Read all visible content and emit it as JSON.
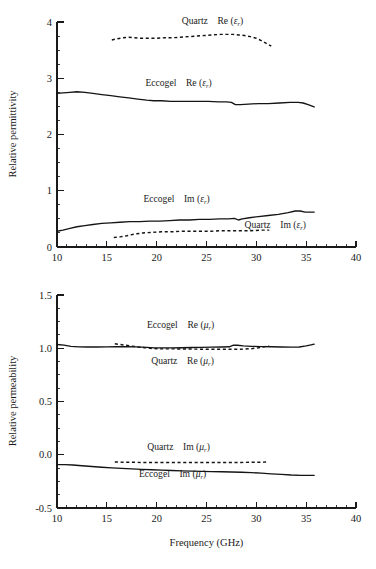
{
  "figure": {
    "name": "permittivity-permeability-vs-frequency",
    "background": "#ffffff",
    "line_color": "#141414"
  },
  "chart_data": [
    {
      "id": "permittivity",
      "type": "line",
      "title": "",
      "xlabel": "",
      "ylabel": "Relative permittivity",
      "xlim": [
        10,
        40
      ],
      "ylim": [
        0,
        4
      ],
      "xticks": [
        10,
        15,
        20,
        25,
        30,
        35,
        40
      ],
      "xticklabels": [
        "10",
        "15",
        "20",
        "25",
        "30",
        "35",
        "40"
      ],
      "yticks": [
        0,
        1,
        2,
        3,
        4
      ],
      "yticklabels": [
        "0",
        "1",
        "2",
        "3",
        "4"
      ],
      "xminor_step": 1,
      "yminor_step": 0.25,
      "grid": false,
      "legend_position": "inline-annotations",
      "series": [
        {
          "name": "Quartz Re (εr)",
          "label_material": "Quartz",
          "label_quantity_prefix": "Re",
          "label_symbol": "ε",
          "label_subscript": "r",
          "style": "dashed",
          "label_x": 25.6,
          "label_y": 3.97,
          "x": [
            15.5,
            16.0,
            16.6,
            17.2,
            17.8,
            18.5,
            19.2,
            20.0,
            20.8,
            21.6,
            22.4,
            23.2,
            24.0,
            24.8,
            25.6,
            26.4,
            27.0,
            27.6,
            28.2,
            28.8,
            29.4,
            30.0,
            30.5,
            31.0,
            31.5
          ],
          "y": [
            3.68,
            3.7,
            3.72,
            3.73,
            3.72,
            3.71,
            3.71,
            3.71,
            3.72,
            3.72,
            3.73,
            3.74,
            3.75,
            3.76,
            3.77,
            3.78,
            3.78,
            3.78,
            3.77,
            3.76,
            3.74,
            3.71,
            3.67,
            3.62,
            3.57
          ]
        },
        {
          "name": "Eccogel Re (εr)",
          "label_material": "Eccogel",
          "label_quantity_prefix": "Re",
          "label_symbol": "ε",
          "label_subscript": "r",
          "style": "solid",
          "label_x": 22.2,
          "label_y": 2.86,
          "x": [
            10.0,
            10.6,
            11.3,
            12.0,
            12.8,
            13.6,
            14.5,
            15.4,
            16.3,
            17.2,
            18.1,
            19.0,
            19.7,
            20.5,
            21.4,
            22.3,
            23.2,
            24.2,
            25.2,
            26.2,
            27.0,
            27.5,
            27.9,
            28.4,
            29.2,
            30.2,
            31.2,
            32.3,
            33.4,
            34.2,
            34.7,
            35.2,
            35.8
          ],
          "y": [
            2.73,
            2.74,
            2.75,
            2.76,
            2.75,
            2.73,
            2.71,
            2.69,
            2.67,
            2.65,
            2.63,
            2.61,
            2.6,
            2.6,
            2.59,
            2.59,
            2.59,
            2.59,
            2.59,
            2.58,
            2.58,
            2.57,
            2.53,
            2.53,
            2.54,
            2.55,
            2.55,
            2.56,
            2.57,
            2.57,
            2.56,
            2.53,
            2.49
          ]
        },
        {
          "name": "Eccogel Im (εr)",
          "label_material": "Eccogel",
          "label_quantity_prefix": "Im",
          "label_symbol": "ε",
          "label_subscript": "r",
          "style": "solid",
          "label_x": 22.0,
          "label_y": 0.8,
          "x": [
            10.0,
            10.6,
            11.3,
            12.0,
            12.8,
            13.6,
            14.5,
            15.4,
            16.3,
            17.3,
            18.3,
            19.3,
            20.3,
            21.3,
            22.3,
            23.3,
            24.3,
            25.3,
            26.3,
            27.2,
            27.8,
            28.2,
            28.6,
            29.3,
            30.2,
            31.2,
            32.2,
            33.2,
            33.9,
            34.4,
            34.9,
            35.4,
            35.8
          ],
          "y": [
            0.28,
            0.3,
            0.33,
            0.36,
            0.38,
            0.4,
            0.42,
            0.43,
            0.44,
            0.45,
            0.45,
            0.46,
            0.46,
            0.47,
            0.48,
            0.48,
            0.49,
            0.49,
            0.5,
            0.5,
            0.51,
            0.48,
            0.5,
            0.52,
            0.54,
            0.56,
            0.58,
            0.61,
            0.64,
            0.64,
            0.62,
            0.62,
            0.62
          ]
        },
        {
          "name": "Quartz Im (εr)",
          "label_material": "Quartz",
          "label_quantity_prefix": "Im",
          "label_symbol": "ε",
          "label_subscript": "r",
          "style": "dashed",
          "label_x": 31.9,
          "label_y": 0.33,
          "x": [
            15.7,
            16.3,
            17.0,
            17.8,
            18.6,
            19.5,
            20.5,
            21.5,
            22.5,
            23.5,
            24.5,
            25.5,
            26.5,
            27.5,
            28.5,
            29.5,
            30.5,
            31.3
          ],
          "y": [
            0.17,
            0.18,
            0.2,
            0.23,
            0.25,
            0.26,
            0.27,
            0.27,
            0.28,
            0.28,
            0.28,
            0.28,
            0.29,
            0.29,
            0.29,
            0.29,
            0.3,
            0.3
          ]
        }
      ]
    },
    {
      "id": "permeability",
      "type": "line",
      "title": "",
      "xlabel": "Frequency (GHz)",
      "ylabel": "Relative permeability",
      "xlim": [
        10,
        40
      ],
      "ylim": [
        -0.5,
        1.5
      ],
      "xticks": [
        10,
        15,
        20,
        25,
        30,
        35,
        40
      ],
      "xticklabels": [
        "10",
        "15",
        "20",
        "25",
        "30",
        "35",
        "40"
      ],
      "yticks": [
        -0.5,
        0.0,
        0.5,
        1.0,
        1.5
      ],
      "yticklabels": [
        "-0.5",
        "0.0",
        "0.5",
        "1.0",
        "1.5"
      ],
      "xminor_step": 1,
      "yminor_step": 0.125,
      "grid": false,
      "legend_position": "inline-annotations",
      "series": [
        {
          "name": "Eccogel Re (μr)",
          "label_material": "Eccogel",
          "label_quantity_prefix": "Re",
          "label_symbol": "μ",
          "label_subscript": "r",
          "style": "solid",
          "label_x": 22.4,
          "label_y": 1.19,
          "x": [
            10.0,
            10.7,
            11.4,
            12.2,
            13.0,
            14.0,
            15.0,
            16.0,
            17.0,
            18.0,
            19.0,
            19.8,
            20.6,
            21.5,
            22.5,
            23.5,
            24.5,
            25.5,
            26.5,
            27.3,
            27.7,
            28.1,
            28.7,
            29.5,
            30.5,
            31.5,
            32.5,
            33.5,
            34.3,
            35.0,
            35.5,
            35.8
          ],
          "y": [
            1.035,
            1.03,
            1.018,
            1.013,
            1.012,
            1.012,
            1.013,
            1.014,
            1.015,
            1.013,
            1.008,
            1.003,
            1.003,
            1.004,
            1.005,
            1.007,
            1.008,
            1.01,
            1.012,
            1.014,
            1.03,
            1.028,
            1.022,
            1.018,
            1.016,
            1.014,
            1.012,
            1.01,
            1.012,
            1.022,
            1.032,
            1.038
          ]
        },
        {
          "name": "Quartz Re (μr)",
          "label_material": "Quartz",
          "label_quantity_prefix": "Re",
          "label_symbol": "μ",
          "label_subscript": "r",
          "style": "dashed",
          "label_x": 22.6,
          "label_y": 0.855,
          "x": [
            15.8,
            16.3,
            16.9,
            17.5,
            18.1,
            18.8,
            19.5,
            20.2,
            21.0,
            21.9,
            22.8,
            23.7,
            24.6,
            25.5,
            26.4,
            27.2,
            28.0,
            28.8,
            29.5,
            30.2,
            30.8,
            31.3
          ],
          "y": [
            1.042,
            1.036,
            1.028,
            1.02,
            1.012,
            1.005,
            0.998,
            0.994,
            0.994,
            0.994,
            0.993,
            0.992,
            0.991,
            0.99,
            0.99,
            0.99,
            0.99,
            0.992,
            0.996,
            1.004,
            1.014,
            1.02
          ]
        },
        {
          "name": "Quartz Im (μr)",
          "label_material": "Quartz",
          "label_quantity_prefix": "Im",
          "label_symbol": "μ",
          "label_subscript": "r",
          "style": "dashed",
          "label_x": 22.2,
          "label_y": 0.045,
          "x": [
            15.8,
            16.6,
            17.5,
            18.5,
            19.5,
            20.5,
            21.5,
            22.5,
            23.5,
            24.5,
            25.5,
            26.5,
            27.5,
            28.5,
            29.5,
            30.4,
            31.2
          ],
          "y": [
            -0.068,
            -0.07,
            -0.071,
            -0.072,
            -0.072,
            -0.073,
            -0.073,
            -0.073,
            -0.073,
            -0.073,
            -0.073,
            -0.073,
            -0.072,
            -0.072,
            -0.071,
            -0.07,
            -0.068
          ]
        },
        {
          "name": "Eccogel Im (μr)",
          "label_material": "Eccogel",
          "label_quantity_prefix": "Im",
          "label_symbol": "μ",
          "label_subscript": "r",
          "style": "solid",
          "label_x": 21.6,
          "label_y": -0.21,
          "x": [
            10.0,
            10.8,
            11.6,
            12.5,
            13.5,
            14.5,
            15.5,
            16.5,
            17.5,
            18.5,
            19.5,
            20.5,
            21.5,
            22.5,
            23.5,
            24.5,
            25.5,
            26.5,
            27.5,
            28.5,
            29.5,
            30.5,
            31.5,
            32.5,
            33.5,
            34.5,
            35.2,
            35.8
          ],
          "y": [
            -0.092,
            -0.093,
            -0.096,
            -0.103,
            -0.11,
            -0.117,
            -0.123,
            -0.128,
            -0.133,
            -0.137,
            -0.141,
            -0.145,
            -0.148,
            -0.151,
            -0.154,
            -0.156,
            -0.158,
            -0.16,
            -0.162,
            -0.164,
            -0.168,
            -0.173,
            -0.179,
            -0.185,
            -0.19,
            -0.193,
            -0.194,
            -0.194
          ]
        }
      ]
    }
  ]
}
